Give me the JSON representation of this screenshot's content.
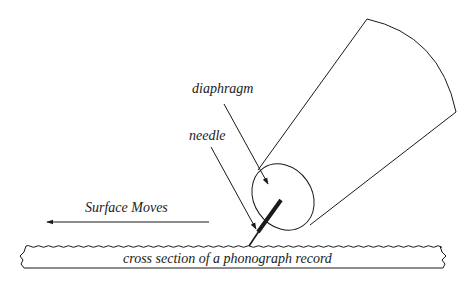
{
  "diagram": {
    "labels": {
      "diaphragm": "diaphragm",
      "needle": "needle",
      "surface_moves": "Surface Moves",
      "record": "cross section of a phonograph record"
    },
    "colors": {
      "stroke": "#1a1a1a",
      "background": "#ffffff"
    }
  }
}
